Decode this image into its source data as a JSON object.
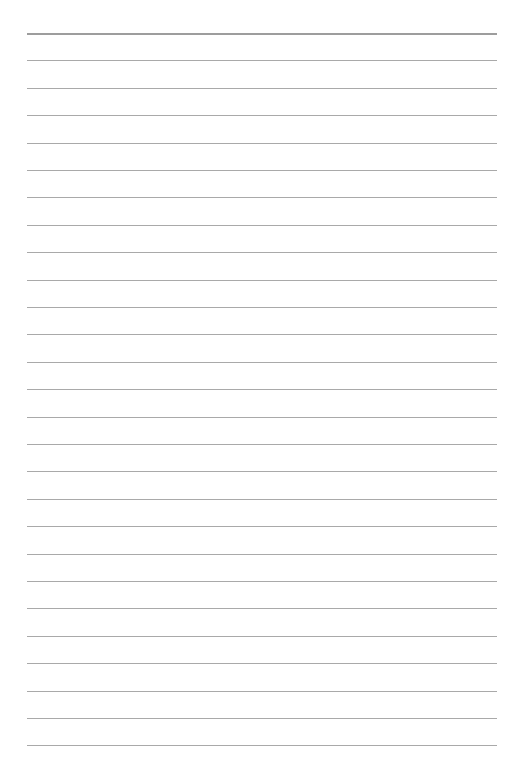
{
  "page": {
    "type": "lined-paper",
    "line_count": 27,
    "first_line_y": 33,
    "line_spacing": 27.4,
    "line_left": 27,
    "line_right": 497,
    "line_color": "#9a9a9a",
    "background_color": "#ffffff"
  }
}
